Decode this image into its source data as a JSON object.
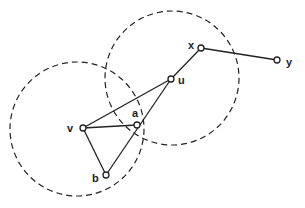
{
  "diagram": {
    "type": "graph-with-disks",
    "nodes": [
      {
        "id": "x",
        "label": "x",
        "cx": 201,
        "cy": 48,
        "lx": 188,
        "ly": 49
      },
      {
        "id": "y",
        "label": "y",
        "cx": 277,
        "cy": 60,
        "lx": 286,
        "ly": 66
      },
      {
        "id": "u",
        "label": "u",
        "cx": 171,
        "cy": 79,
        "lx": 178,
        "ly": 84
      },
      {
        "id": "a",
        "label": "a",
        "cx": 137,
        "cy": 125,
        "lx": 132,
        "ly": 117
      },
      {
        "id": "v",
        "label": "v",
        "cx": 83,
        "cy": 128,
        "lx": 67,
        "ly": 132
      },
      {
        "id": "b",
        "label": "b",
        "cx": 106,
        "cy": 175,
        "lx": 92,
        "ly": 182
      }
    ],
    "edges": [
      [
        "x",
        "y"
      ],
      [
        "x",
        "u"
      ],
      [
        "u",
        "v"
      ],
      [
        "u",
        "b"
      ],
      [
        "v",
        "a"
      ],
      [
        "v",
        "b"
      ]
    ],
    "circles": [
      {
        "name": "disk-around-v",
        "cx": 77,
        "cy": 129,
        "r": 67
      },
      {
        "name": "disk-around-u",
        "cx": 172,
        "cy": 78,
        "r": 67
      }
    ],
    "colors": {
      "stroke": "#222222",
      "background": "#ffffff"
    }
  }
}
